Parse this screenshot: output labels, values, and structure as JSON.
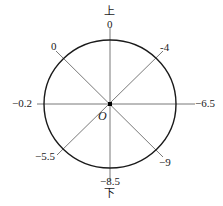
{
  "diagram": {
    "type": "circle-with-radial-lines",
    "center_label": "O",
    "direction_labels": {
      "top": "上",
      "bottom": "下"
    },
    "endpoint_labels": {
      "top": "0",
      "top_left": "0",
      "top_right": "-4",
      "left": "−0.2",
      "right": "−6.5",
      "bottom_left": "−5.5",
      "bottom_right": "−9",
      "bottom": "−8.5"
    },
    "colors": {
      "circle": "#1a1a1a",
      "lines": "#555555",
      "text": "#1a1a1a",
      "background": "#ffffff"
    }
  }
}
